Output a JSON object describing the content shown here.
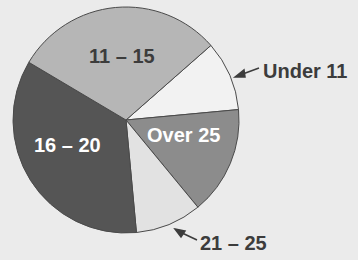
{
  "chart_data": {
    "type": "pie",
    "title": "",
    "start_angle_deg": 41.3,
    "direction": "clockwise",
    "slices": [
      {
        "label": "Under 11",
        "value": 10,
        "color": "#f2f2f2",
        "label_color": "#3c3c3c",
        "label_position": "outside"
      },
      {
        "label": "Over 25",
        "value": 15.5,
        "color": "#8c8c8c",
        "label_color": "#ffffff",
        "label_position": "inside"
      },
      {
        "label": "21 – 25",
        "value": 9.5,
        "color": "#e2e2e2",
        "label_color": "#3c3c3c",
        "label_position": "outside"
      },
      {
        "label": "16 – 20",
        "value": 35,
        "color": "#555555",
        "label_color": "#ffffff",
        "label_position": "inside"
      },
      {
        "label": "11 – 15",
        "value": 30,
        "color": "#b6b6b6",
        "label_color": "#3c3c3c",
        "label_position": "inside"
      }
    ],
    "legend": "none"
  },
  "labels": {
    "under11": "Under 11",
    "over25": "Over 25",
    "r21_25": "21 – 25",
    "r16_20": "16 – 20",
    "r11_15": "11 – 15"
  }
}
